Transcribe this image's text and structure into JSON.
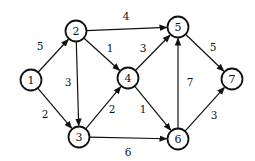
{
  "graph": {
    "type": "directed-weighted",
    "nodes": [
      {
        "id": "1",
        "label": "1",
        "x": 31,
        "y": 80
      },
      {
        "id": "2",
        "label": "2",
        "x": 76,
        "y": 31
      },
      {
        "id": "3",
        "label": "3",
        "x": 79,
        "y": 137
      },
      {
        "id": "4",
        "label": "4",
        "x": 128,
        "y": 78
      },
      {
        "id": "5",
        "label": "5",
        "x": 178,
        "y": 27
      },
      {
        "id": "6",
        "label": "6",
        "x": 178,
        "y": 139
      },
      {
        "id": "7",
        "label": "7",
        "x": 232,
        "y": 79
      }
    ],
    "edges": [
      {
        "from": "1",
        "to": "2",
        "weight": "5",
        "lx": 40,
        "ly": 50
      },
      {
        "from": "1",
        "to": "3",
        "weight": "2",
        "lx": 45,
        "ly": 118
      },
      {
        "from": "2",
        "to": "5",
        "weight": "4",
        "lx": 126,
        "ly": 20
      },
      {
        "from": "2",
        "to": "4",
        "weight": "1",
        "lx": 110,
        "ly": 52
      },
      {
        "from": "2",
        "to": "3",
        "weight": "3",
        "lx": 68,
        "ly": 86
      },
      {
        "from": "3",
        "to": "4",
        "weight": "2",
        "lx": 112,
        "ly": 113
      },
      {
        "from": "3",
        "to": "6",
        "weight": "6",
        "lx": 128,
        "ly": 156
      },
      {
        "from": "4",
        "to": "5",
        "weight": "3",
        "lx": 143,
        "ly": 52
      },
      {
        "from": "4",
        "to": "6",
        "weight": "1",
        "lx": 143,
        "ly": 113
      },
      {
        "from": "6",
        "to": "5",
        "weight": "7",
        "lx": 190,
        "ly": 86
      },
      {
        "from": "5",
        "to": "7",
        "weight": "5",
        "lx": 213,
        "ly": 51
      },
      {
        "from": "6",
        "to": "7",
        "weight": "3",
        "lx": 214,
        "ly": 119
      }
    ]
  }
}
